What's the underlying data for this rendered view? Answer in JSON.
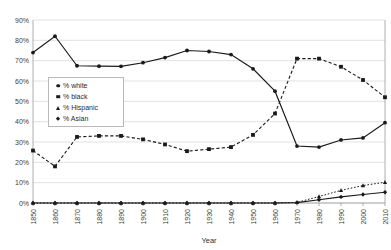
{
  "chart_data": {
    "type": "line",
    "title": "",
    "xlabel": "Year",
    "ylabel": "",
    "grid": true,
    "legend_position": "inside-left",
    "x": [
      1850,
      1860,
      1870,
      1880,
      1890,
      1900,
      1910,
      1920,
      1930,
      1940,
      1950,
      1960,
      1970,
      1980,
      1990,
      2000,
      2010
    ],
    "xticklabels": [
      "1850",
      "1860",
      "1870",
      "1880",
      "1890",
      "1900",
      "1910",
      "1920",
      "1930",
      "1940",
      "1950",
      "1960",
      "1970",
      "1980",
      "1990",
      "2000",
      "2010"
    ],
    "yticklabels": [
      "0%",
      "10%",
      "20%",
      "30%",
      "40%",
      "50%",
      "60%",
      "70%",
      "80%",
      "90%"
    ],
    "yticks": [
      0,
      10,
      20,
      30,
      40,
      50,
      60,
      70,
      80,
      90
    ],
    "ylim": [
      0,
      90
    ],
    "xlim": [
      1850,
      2010
    ],
    "series": [
      {
        "name": "% white",
        "marker": "circle",
        "linestyle": "solid",
        "values": [
          74,
          82,
          67.5,
          67.3,
          67.2,
          69,
          71.5,
          75,
          74.5,
          73,
          66,
          55,
          28,
          27.5,
          31,
          32,
          39.5
        ]
      },
      {
        "name": "% black",
        "marker": "square",
        "linestyle": "dashed",
        "values": [
          25.8,
          18,
          32.5,
          33,
          33,
          31.3,
          28.8,
          25.5,
          26.5,
          27.5,
          33.5,
          44,
          71,
          71,
          67,
          60.5,
          52
        ]
      },
      {
        "name": "% Hispanic",
        "marker": "triangle",
        "linestyle": "dotted",
        "values": [
          0,
          0,
          0,
          0,
          0,
          0,
          0,
          0,
          0,
          0,
          0,
          0,
          0.3,
          3.2,
          6.2,
          8.6,
          10.2
        ]
      },
      {
        "name": "% Asian",
        "marker": "diamond",
        "linestyle": "solid",
        "values": [
          0,
          0,
          0,
          0,
          0,
          0,
          0,
          0,
          0,
          0,
          0,
          0,
          0.2,
          1.6,
          3,
          4.2,
          5.3
        ]
      }
    ]
  },
  "legend": {
    "items": [
      {
        "label": "% white",
        "marker": "circle"
      },
      {
        "label": "% black",
        "marker": "square"
      },
      {
        "label": "% Hispanic",
        "marker": "triangle"
      },
      {
        "label": "% Asian",
        "marker": "diamond"
      }
    ]
  },
  "axis": {
    "x_title": "Year"
  }
}
